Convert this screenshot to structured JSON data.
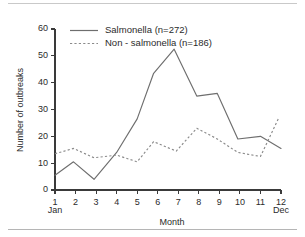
{
  "figure": {
    "has_top_rule": true,
    "has_bottom_rule": true,
    "background": "#ffffff",
    "ink_color": "#2b2b2b"
  },
  "chart_data": {
    "type": "line",
    "title": "",
    "xlabel": "Month",
    "ylabel": "Number of outbreaks",
    "xlim": [
      1,
      12
    ],
    "ylim": [
      0,
      60
    ],
    "yticks": [
      0,
      10,
      20,
      30,
      40,
      50,
      60
    ],
    "xticks": [
      1,
      2,
      3,
      4,
      5,
      6,
      7,
      8,
      9,
      10,
      11,
      12
    ],
    "xtick_labels": [
      "1",
      "2",
      "3",
      "4",
      "5",
      "6",
      "7",
      "8",
      "9",
      "10",
      "11",
      "12"
    ],
    "ytick_labels": [
      "0",
      "10",
      "20",
      "30",
      "40",
      "50",
      "60"
    ],
    "x_edge_labels": {
      "left": "Jan",
      "right": "Dec"
    },
    "grid": false,
    "legend_position": "top-center",
    "legend": [
      {
        "name": "Salmonella (n=272)",
        "style": "solid",
        "color": "#6e6e6e"
      },
      {
        "name": "Non - salmonella (n=186)",
        "style": "dotted",
        "color": "#8a8a8a"
      }
    ],
    "categories": [
      1,
      2,
      3,
      4,
      5,
      6,
      7,
      8,
      9,
      10,
      11,
      12
    ],
    "series": [
      {
        "name": "Salmonella (n=272)",
        "style": "solid",
        "total": 272,
        "x": [
          1,
          1.9,
          2.9,
          4,
          5,
          5.8,
          6.8,
          7.9,
          8.9,
          9.9,
          11,
          12
        ],
        "values": [
          5.5,
          10.5,
          4,
          14,
          26.5,
          43.5,
          52.5,
          35,
          36,
          19,
          20,
          15.5
        ]
      },
      {
        "name": "Non - salmonella (n=186)",
        "style": "dotted",
        "total": 186,
        "x": [
          1,
          1.9,
          2.9,
          4,
          5,
          5.8,
          6.9,
          7.9,
          8.9,
          9.9,
          11,
          11.9
        ],
        "values": [
          13.5,
          15.5,
          12,
          13,
          10.5,
          18,
          14.5,
          23,
          19,
          14,
          12.5,
          27
        ]
      }
    ]
  }
}
